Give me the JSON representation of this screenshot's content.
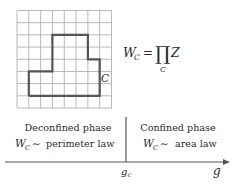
{
  "diagram": {
    "lattice": {
      "columns": 8,
      "rows": 8,
      "grid_color": "#b8b8b8",
      "contour_color": "#555555",
      "contour_vertices_cells": [
        [
          1,
          7
        ],
        [
          1,
          5
        ],
        [
          3,
          5
        ],
        [
          3,
          2
        ],
        [
          6,
          2
        ],
        [
          6,
          4
        ],
        [
          7,
          4
        ],
        [
          7,
          7
        ],
        [
          1,
          7
        ]
      ],
      "contour_label": "C"
    },
    "formula": {
      "lhs": "W",
      "lhs_subscript": "C",
      "equals": "=",
      "operator": "∏",
      "operator_subscript": "C",
      "operand": "Z"
    },
    "phases": {
      "left": {
        "title": "Deconfined phase",
        "law_symbol": "W",
        "law_subscript": "C",
        "law_relation": "∼",
        "law_text": "perimeter law"
      },
      "right": {
        "title": "Confined phase",
        "law_symbol": "W",
        "law_subscript": "C",
        "law_relation": "∼",
        "law_text": "area law"
      }
    },
    "axis": {
      "variable": "g",
      "critical_point": "g",
      "critical_subscript": "c",
      "axis_color": "#555555"
    }
  }
}
